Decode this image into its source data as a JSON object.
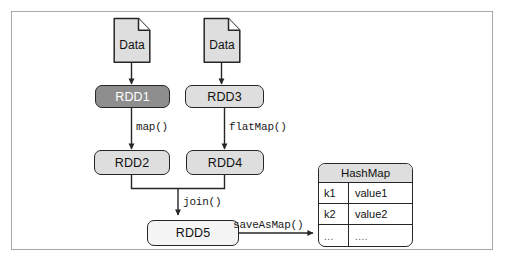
{
  "diagram": {
    "frame": {
      "border_color": "#a8a8a8"
    },
    "sources": [
      {
        "id": "data1",
        "label": "Data",
        "shape": "document-icon",
        "fill": "#dedede"
      },
      {
        "id": "data2",
        "label": "Data",
        "shape": "document-icon",
        "fill": "#dedede"
      }
    ],
    "nodes": [
      {
        "id": "rdd1",
        "label": "RDD1",
        "fill": "#8e8e8e",
        "text_color": "#ffffff"
      },
      {
        "id": "rdd3",
        "label": "RDD3",
        "fill": "#dedede",
        "text_color": "#111111"
      },
      {
        "id": "rdd2",
        "label": "RDD2",
        "fill": "#dedede",
        "text_color": "#111111"
      },
      {
        "id": "rdd4",
        "label": "RDD4",
        "fill": "#dedede",
        "text_color": "#111111"
      },
      {
        "id": "rdd5",
        "label": "RDD5",
        "fill": "#f4f4f4",
        "text_color": "#111111"
      }
    ],
    "edges": [
      {
        "id": "e1",
        "from": "data1",
        "to": "rdd1",
        "label": ""
      },
      {
        "id": "e2",
        "from": "data2",
        "to": "rdd3",
        "label": ""
      },
      {
        "id": "e3",
        "from": "rdd1",
        "to": "rdd2",
        "label": "map()"
      },
      {
        "id": "e4",
        "from": "rdd3",
        "to": "rdd4",
        "label": "flatMap()"
      },
      {
        "id": "e5",
        "from": "rdd2+rdd4",
        "to": "rdd5",
        "label": "join()"
      },
      {
        "id": "e6",
        "from": "rdd5",
        "to": "hashmap",
        "label": "saveAsMap()"
      }
    ],
    "hashmap": {
      "title": "HashMap",
      "rows": [
        {
          "key": "k1",
          "value": "value1"
        },
        {
          "key": "k2",
          "value": "value2"
        },
        {
          "key": "...",
          "value": "...."
        }
      ]
    }
  }
}
